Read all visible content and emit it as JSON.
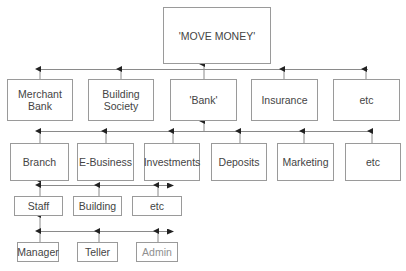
{
  "diagram": {
    "type": "hierarchy",
    "root": {
      "label": "'MOVE MONEY'"
    },
    "level1": [
      {
        "label": "Merchant\nBank"
      },
      {
        "label": "Building\nSociety"
      },
      {
        "label": "'Bank'"
      },
      {
        "label": "Insurance"
      },
      {
        "label": "etc"
      }
    ],
    "level2_parent": "'Bank'",
    "level2": [
      {
        "label": "Branch"
      },
      {
        "label": "E-Business"
      },
      {
        "label": "Investments"
      },
      {
        "label": "Deposits"
      },
      {
        "label": "Marketing"
      },
      {
        "label": "etc"
      }
    ],
    "level3_parent": "Branch",
    "level3": [
      {
        "label": "Staff"
      },
      {
        "label": "Building"
      },
      {
        "label": "etc"
      }
    ],
    "level4_parent": "Staff",
    "level4": [
      {
        "label": "Manager"
      },
      {
        "label": "Teller"
      },
      {
        "label": "Admin"
      }
    ],
    "colors": {
      "line": "#8a8a8a",
      "arrow": "#222222",
      "border": "#9a9a9a",
      "text": "#444444"
    }
  }
}
